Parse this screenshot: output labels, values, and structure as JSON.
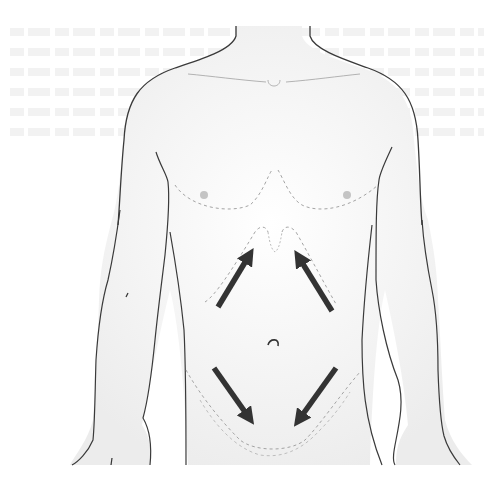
{
  "figure": {
    "arrows": [
      {
        "id": "upper-left",
        "direction": "up-right",
        "from": [
          218,
          307
        ],
        "to": [
          252,
          250
        ]
      },
      {
        "id": "upper-right",
        "direction": "up-left",
        "from": [
          332,
          311
        ],
        "to": [
          296,
          252
        ]
      },
      {
        "id": "lower-left",
        "direction": "down-right",
        "from": [
          214,
          368
        ],
        "to": [
          252,
          422
        ]
      },
      {
        "id": "lower-right",
        "direction": "down-left",
        "from": [
          336,
          368
        ],
        "to": [
          296,
          424
        ]
      }
    ],
    "colors": {
      "outline": "#3a3a3a",
      "dashed_guides": "#9a9a9a",
      "skin_shade": "#f2f2f2",
      "arrow": "#333333",
      "nipple": "#b8b8b8"
    }
  }
}
